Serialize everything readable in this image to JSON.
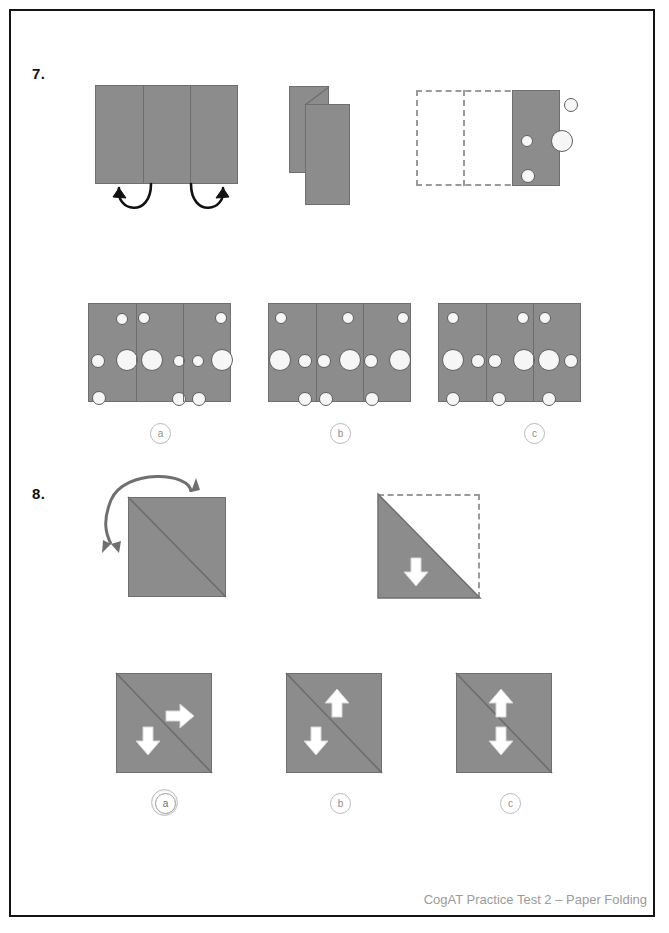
{
  "page": {
    "footer": "CogAT Practice Test 2 – Paper Folding",
    "paper_color": "#8c8c8c",
    "hole_color": "#f6f6f6",
    "dash_color": "#9a9a9a",
    "border_color": "#141414"
  },
  "questions": [
    {
      "number": "7.",
      "type": "paper-folding",
      "prompt_panels": [
        {
          "name": "unfolded-sheet",
          "panels": 3,
          "folds": "both outer thirds fold to center"
        },
        {
          "name": "folded-stack",
          "layers": 2
        },
        {
          "name": "punched-panel",
          "holes": 4
        }
      ],
      "options": [
        {
          "label": "a",
          "selected": false
        },
        {
          "label": "b",
          "selected": false
        },
        {
          "label": "c",
          "selected": false
        }
      ]
    },
    {
      "number": "8.",
      "type": "paper-folding",
      "prompt_panels": [
        {
          "name": "unfolded-square",
          "fold": "diagonal top-right corner to bottom-left"
        },
        {
          "name": "folded-triangle",
          "cutouts": 1,
          "cutout_shape": "down-arrow"
        }
      ],
      "options": [
        {
          "label": "a",
          "selected": true
        },
        {
          "label": "b",
          "selected": false
        },
        {
          "label": "c",
          "selected": false
        }
      ]
    }
  ],
  "q7_options_holes": {
    "a": [
      {
        "cx": 33,
        "cy": 15,
        "r": 6
      },
      {
        "cx": 55,
        "cy": 14,
        "r": 6
      },
      {
        "cx": 132,
        "cy": 14,
        "r": 6
      },
      {
        "cx": 9,
        "cy": 57,
        "r": 7
      },
      {
        "cx": 38,
        "cy": 56,
        "r": 11
      },
      {
        "cx": 63,
        "cy": 56,
        "r": 11
      },
      {
        "cx": 90,
        "cy": 57,
        "r": 6
      },
      {
        "cx": 109,
        "cy": 57,
        "r": 6
      },
      {
        "cx": 133,
        "cy": 56,
        "r": 11
      },
      {
        "cx": 10,
        "cy": 94,
        "r": 7
      },
      {
        "cx": 90,
        "cy": 95,
        "r": 7
      },
      {
        "cx": 110,
        "cy": 95,
        "r": 7
      }
    ],
    "b": [
      {
        "cx": 12,
        "cy": 14,
        "r": 6
      },
      {
        "cx": 79,
        "cy": 14,
        "r": 6
      },
      {
        "cx": 134,
        "cy": 14,
        "r": 6
      },
      {
        "cx": 11,
        "cy": 56,
        "r": 11
      },
      {
        "cx": 36,
        "cy": 57,
        "r": 7
      },
      {
        "cx": 55,
        "cy": 57,
        "r": 7
      },
      {
        "cx": 81,
        "cy": 56,
        "r": 11
      },
      {
        "cx": 102,
        "cy": 57,
        "r": 7
      },
      {
        "cx": 131,
        "cy": 56,
        "r": 11
      },
      {
        "cx": 36,
        "cy": 95,
        "r": 7
      },
      {
        "cx": 57,
        "cy": 95,
        "r": 7
      },
      {
        "cx": 103,
        "cy": 95,
        "r": 7
      }
    ],
    "c": [
      {
        "cx": 14,
        "cy": 14,
        "r": 6
      },
      {
        "cx": 84,
        "cy": 14,
        "r": 6
      },
      {
        "cx": 106,
        "cy": 14,
        "r": 6
      },
      {
        "cx": 14,
        "cy": 56,
        "r": 11
      },
      {
        "cx": 39,
        "cy": 57,
        "r": 7
      },
      {
        "cx": 56,
        "cy": 57,
        "r": 7
      },
      {
        "cx": 85,
        "cy": 56,
        "r": 11
      },
      {
        "cx": 110,
        "cy": 56,
        "r": 11
      },
      {
        "cx": 132,
        "cy": 57,
        "r": 7
      },
      {
        "cx": 14,
        "cy": 95,
        "r": 7
      },
      {
        "cx": 60,
        "cy": 95,
        "r": 7
      },
      {
        "cx": 110,
        "cy": 95,
        "r": 7
      }
    ]
  },
  "q7_punched_holes": [
    {
      "cx": 58,
      "cy": 14,
      "r": 7
    },
    {
      "cx": 14,
      "cy": 50,
      "r": 6
    },
    {
      "cx": 49,
      "cy": 50,
      "r": 11
    },
    {
      "cx": 15,
      "cy": 85,
      "r": 7
    }
  ],
  "q8_option_arrows": {
    "a": [
      {
        "dir": "right",
        "x": 62,
        "y": 38
      },
      {
        "dir": "down",
        "x": 27,
        "y": 72
      }
    ],
    "b": [
      {
        "dir": "up",
        "x": 46,
        "y": 18
      },
      {
        "dir": "down",
        "x": 25,
        "y": 72
      }
    ],
    "c": [
      {
        "dir": "up",
        "x": 40,
        "y": 18
      },
      {
        "dir": "down",
        "x": 40,
        "y": 72
      }
    ]
  }
}
